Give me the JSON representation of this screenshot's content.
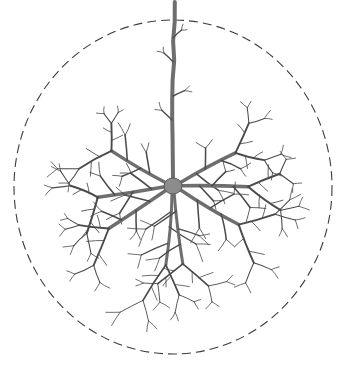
{
  "figure": {
    "caption": "",
    "background_color": "#ffffff"
  },
  "colors": {
    "dendrite_stroke": "#6e6e6e",
    "twig_stroke": "#4a4a4a",
    "soma_fill": "#8c8c8c",
    "soma_stroke": "#5a5a5a",
    "boundary_stroke": "#3b3b3b"
  },
  "canvas": {
    "width": 346,
    "height": 366
  },
  "boundary_circle": {
    "label": "dendritic-field-boundary",
    "center_x": 173,
    "center_y": 187,
    "radius_x": 159,
    "radius_y": 167,
    "dash_length": 9,
    "gap_length": 5,
    "stroke_width": 1.1
  },
  "soma": {
    "label": "soma",
    "center_x": 173,
    "center_y": 186,
    "radius_x": 9,
    "radius_y": 8
  },
  "apical_axon": {
    "label": "apical-dendrite-trunk",
    "from_x": 173,
    "from_y": 178,
    "to_x": 174,
    "to_y": 2,
    "width": 4.0
  },
  "primary_dendrites": [
    {
      "name": "dendrite-up-left",
      "angle_deg": 152,
      "length": 150,
      "base_width": 3.4
    },
    {
      "name": "dendrite-up-right",
      "angle_deg": 28,
      "length": 150,
      "base_width": 3.4
    },
    {
      "name": "dendrite-left",
      "angle_deg": 186,
      "length": 162,
      "base_width": 3.6
    },
    {
      "name": "dendrite-right",
      "angle_deg": 2,
      "length": 160,
      "base_width": 3.6
    },
    {
      "name": "dendrite-down-left",
      "angle_deg": 215,
      "length": 165,
      "base_width": 3.4
    },
    {
      "name": "dendrite-down-right",
      "angle_deg": 330,
      "length": 163,
      "base_width": 3.4
    },
    {
      "name": "basal-dendrite-down-inner-left",
      "angle_deg": 263,
      "length": 172,
      "base_width": 3.0
    },
    {
      "name": "basal-dendrite-down-inner-right",
      "angle_deg": 278,
      "length": 170,
      "base_width": 3.0
    }
  ],
  "branching": {
    "levels": 4,
    "branch_angle_deg": 42,
    "length_ratio": 0.52,
    "width_ratio": 0.55,
    "children_per_node": 2,
    "description": "Recursive bifurcating dendritic arbor with fine terminal twigs"
  },
  "seed": 20240517
}
